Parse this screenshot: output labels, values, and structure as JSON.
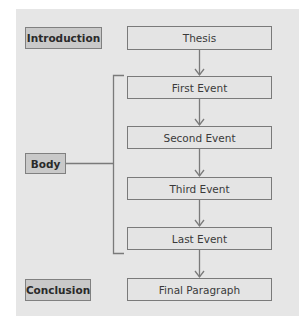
{
  "diagram": {
    "type": "essay-structure-flowchart",
    "section_labels": [
      {
        "id": "introduction",
        "label": "Introduction"
      },
      {
        "id": "body",
        "label": "Body"
      },
      {
        "id": "conclusion",
        "label": "Conclusion"
      }
    ],
    "steps": [
      {
        "id": "thesis",
        "label": "Thesis",
        "section": "introduction"
      },
      {
        "id": "first-event",
        "label": "First Event",
        "section": "body"
      },
      {
        "id": "second-event",
        "label": "Second Event",
        "section": "body"
      },
      {
        "id": "third-event",
        "label": "Third Event",
        "section": "body"
      },
      {
        "id": "last-event",
        "label": "Last Event",
        "section": "body"
      },
      {
        "id": "final-paragraph",
        "label": "Final Paragraph",
        "section": "conclusion"
      }
    ],
    "edges": [
      [
        "thesis",
        "first-event"
      ],
      [
        "first-event",
        "second-event"
      ],
      [
        "second-event",
        "third-event"
      ],
      [
        "third-event",
        "last-event"
      ],
      [
        "last-event",
        "final-paragraph"
      ]
    ],
    "colors": {
      "panel_background": "#e6e6e6",
      "label_fill": "#c9c9c9",
      "box_fill": "#e4e4e4",
      "border": "#7a7a7a",
      "text": "#333333"
    }
  }
}
